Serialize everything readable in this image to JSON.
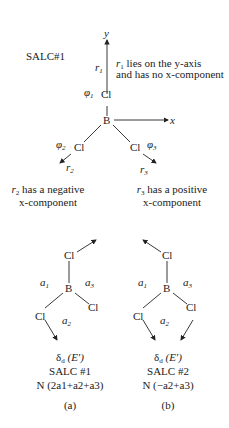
{
  "top": {
    "title": "SALC#1",
    "axes": {
      "y": "y",
      "x": "x"
    },
    "atoms": {
      "center": "B",
      "ligand1": "Cl",
      "ligand2": "Cl",
      "ligand3": "Cl"
    },
    "orbitals": {
      "phi1": "φ",
      "phi1_sub": "1",
      "phi2": "φ",
      "phi2_sub": "2",
      "phi3": "φ",
      "phi3_sub": "3"
    },
    "vectors": {
      "r1": "r",
      "r1_sub": "1",
      "r2": "r",
      "r2_sub": "2",
      "r3": "r",
      "r3_sub": "3"
    },
    "notes": {
      "r1_line1": "lies on the y-axis",
      "r1_line2": "and has no x-component",
      "r2_line1": "has a negative",
      "r2_line2": "x-component",
      "r3_line1": "has a positive",
      "r3_line2": "x-component"
    }
  },
  "panels": [
    {
      "id": "a",
      "atoms": {
        "center": "B",
        "top": "Cl",
        "left": "Cl",
        "right": "Cl"
      },
      "regions": {
        "a1": "a",
        "a1_sub": "1",
        "a2": "a",
        "a2_sub": "2",
        "a3": "a",
        "a3_sub": "3"
      },
      "symmetry": "δ",
      "symmetry_sub": "d",
      "irrep": "(E′)",
      "salc": "SALC #1",
      "normalization": "N (2a1+a2+a3)",
      "label": "(a)"
    },
    {
      "id": "b",
      "atoms": {
        "center": "B",
        "top": "Cl",
        "left": "Cl",
        "right": "Cl"
      },
      "regions": {
        "a1": "a",
        "a1_sub": "1",
        "a2": "a",
        "a2_sub": "2",
        "a3": "a",
        "a3_sub": "3"
      },
      "symmetry": "δ",
      "symmetry_sub": "d",
      "irrep": "(E′)",
      "salc": "SALC #2",
      "normalization": "N (−a2+a3)",
      "label": "(b)"
    }
  ],
  "colors": {
    "ink": "#222222",
    "background": "#ffffff"
  }
}
